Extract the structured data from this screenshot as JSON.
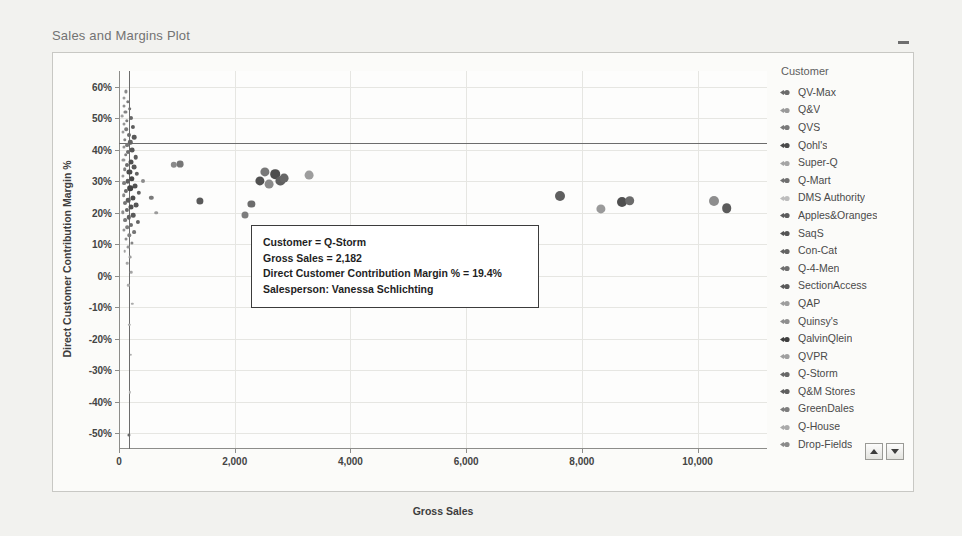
{
  "object": {
    "title": "Sales and Margins Plot",
    "minimize_label": "Minimize"
  },
  "legend": {
    "title": "Customer",
    "items": [
      {
        "label": "QV-Max",
        "color": "#6b6b6b"
      },
      {
        "label": "Q&V",
        "color": "#9a9a9a"
      },
      {
        "label": "QVS",
        "color": "#7a7a7a"
      },
      {
        "label": "Qohl's",
        "color": "#4a4a4a"
      },
      {
        "label": "Super-Q",
        "color": "#a5a5a5"
      },
      {
        "label": "Q-Mart",
        "color": "#707070"
      },
      {
        "label": "DMS Authority",
        "color": "#bdbdbd"
      },
      {
        "label": "Apples&Oranges",
        "color": "#5c5c5c"
      },
      {
        "label": "SaqS",
        "color": "#555555"
      },
      {
        "label": "Con-Cat",
        "color": "#636363"
      },
      {
        "label": "Q-4-Men",
        "color": "#6f6f6f"
      },
      {
        "label": "SectionAccess",
        "color": "#5a5a5a"
      },
      {
        "label": "QAP",
        "color": "#9e9e9e"
      },
      {
        "label": "Quinsy's",
        "color": "#8e8e8e"
      },
      {
        "label": "QalvinQlein",
        "color": "#3f3f3f"
      },
      {
        "label": "QVPR",
        "color": "#a0a0a0"
      },
      {
        "label": "Q-Storm",
        "color": "#686868"
      },
      {
        "label": "Q&M Stores",
        "color": "#5f5f5f"
      },
      {
        "label": "GreenDales",
        "color": "#7d7d7d"
      },
      {
        "label": "Q-House",
        "color": "#aaaaaa"
      },
      {
        "label": "Drop-Fields",
        "color": "#8a8a8a"
      }
    ],
    "scroll_up_label": "Scroll legend up",
    "scroll_down_label": "Scroll legend down"
  },
  "tooltip": {
    "line1": "Customer = Q-Storm",
    "line2": "Gross Sales = 2,182",
    "line3": "Direct Customer Contribution Margin % = 19.4%",
    "line4": "Salesperson: Vanessa Schlichting"
  },
  "chart_data": {
    "type": "scatter",
    "title": "Sales and Margins Plot",
    "xlabel": "Gross Sales",
    "ylabel": "Direct Customer Contribution Margin %",
    "xlim": [
      0,
      11200
    ],
    "ylim": [
      -0.55,
      0.65
    ],
    "xticks": [
      0,
      2000,
      4000,
      6000,
      8000,
      10000
    ],
    "xtick_labels": [
      "0",
      "2,000",
      "4,000",
      "6,000",
      "8,000",
      "10,000"
    ],
    "yticks": [
      0.6,
      0.5,
      0.4,
      0.3,
      0.2,
      0.1,
      0.0,
      -0.1,
      -0.2,
      -0.3,
      -0.4,
      -0.5
    ],
    "ytick_labels": [
      "60%",
      "50%",
      "40%",
      "30%",
      "20%",
      "10%",
      "0%",
      "-10%",
      "-20%",
      "-30%",
      "-40%",
      "-50%"
    ],
    "grid": true,
    "legend_position": "right",
    "reference_lines": [
      {
        "orientation": "horizontal",
        "value": 0.42
      },
      {
        "orientation": "vertical",
        "value": 170
      }
    ],
    "points": [
      {
        "x": 120,
        "y": 0.585,
        "r": 1.6,
        "c": "#8a8a8a"
      },
      {
        "x": 95,
        "y": 0.565,
        "r": 1.5,
        "c": "#9c9c9c"
      },
      {
        "x": 150,
        "y": 0.552,
        "r": 1.7,
        "c": "#7b7b7b"
      },
      {
        "x": 80,
        "y": 0.54,
        "r": 1.5,
        "c": "#8f8f8f"
      },
      {
        "x": 185,
        "y": 0.53,
        "r": 1.8,
        "c": "#6f6f6f"
      },
      {
        "x": 110,
        "y": 0.519,
        "r": 1.6,
        "c": "#848484"
      },
      {
        "x": 60,
        "y": 0.508,
        "r": 1.4,
        "c": "#a0a0a0"
      },
      {
        "x": 205,
        "y": 0.5,
        "r": 2.0,
        "c": "#676767"
      },
      {
        "x": 140,
        "y": 0.492,
        "r": 1.7,
        "c": "#7d7d7d"
      },
      {
        "x": 90,
        "y": 0.481,
        "r": 1.5,
        "c": "#959595"
      },
      {
        "x": 240,
        "y": 0.473,
        "r": 2.1,
        "c": "#5e5e5e"
      },
      {
        "x": 125,
        "y": 0.465,
        "r": 1.8,
        "c": "#7a7a7a"
      },
      {
        "x": 70,
        "y": 0.455,
        "r": 1.5,
        "c": "#9b9b9b"
      },
      {
        "x": 175,
        "y": 0.447,
        "r": 2.0,
        "c": "#6b6b6b"
      },
      {
        "x": 265,
        "y": 0.44,
        "r": 2.3,
        "c": "#585858"
      },
      {
        "x": 105,
        "y": 0.432,
        "r": 1.7,
        "c": "#828282"
      },
      {
        "x": 195,
        "y": 0.424,
        "r": 2.2,
        "c": "#636363"
      },
      {
        "x": 145,
        "y": 0.416,
        "r": 1.9,
        "c": "#757575"
      },
      {
        "x": 85,
        "y": 0.408,
        "r": 1.6,
        "c": "#909090"
      },
      {
        "x": 230,
        "y": 0.4,
        "r": 2.4,
        "c": "#565656"
      },
      {
        "x": 160,
        "y": 0.392,
        "r": 2.0,
        "c": "#6e6e6e"
      },
      {
        "x": 115,
        "y": 0.384,
        "r": 1.8,
        "c": "#7f7f7f"
      },
      {
        "x": 290,
        "y": 0.376,
        "r": 2.3,
        "c": "#5c5c5c"
      },
      {
        "x": 75,
        "y": 0.368,
        "r": 1.6,
        "c": "#949494"
      },
      {
        "x": 205,
        "y": 0.36,
        "r": 2.5,
        "c": "#4f4f4f"
      },
      {
        "x": 135,
        "y": 0.352,
        "r": 2.0,
        "c": "#6c6c6c"
      },
      {
        "x": 255,
        "y": 0.345,
        "r": 2.4,
        "c": "#585858"
      },
      {
        "x": 100,
        "y": 0.338,
        "r": 1.8,
        "c": "#808080"
      },
      {
        "x": 180,
        "y": 0.33,
        "r": 2.6,
        "c": "#4c4c4c"
      },
      {
        "x": 310,
        "y": 0.323,
        "r": 2.2,
        "c": "#626262"
      },
      {
        "x": 65,
        "y": 0.316,
        "r": 1.6,
        "c": "#9a9a9a"
      },
      {
        "x": 220,
        "y": 0.308,
        "r": 2.7,
        "c": "#474747"
      },
      {
        "x": 150,
        "y": 0.3,
        "r": 2.3,
        "c": "#5f5f5f"
      },
      {
        "x": 95,
        "y": 0.293,
        "r": 1.9,
        "c": "#7c7c7c"
      },
      {
        "x": 275,
        "y": 0.286,
        "r": 2.5,
        "c": "#525252"
      },
      {
        "x": 190,
        "y": 0.278,
        "r": 2.8,
        "c": "#444444"
      },
      {
        "x": 120,
        "y": 0.27,
        "r": 2.1,
        "c": "#6a6a6a"
      },
      {
        "x": 340,
        "y": 0.263,
        "r": 2.2,
        "c": "#616161"
      },
      {
        "x": 80,
        "y": 0.255,
        "r": 1.8,
        "c": "#888888"
      },
      {
        "x": 235,
        "y": 0.248,
        "r": 2.6,
        "c": "#4d4d4d"
      },
      {
        "x": 160,
        "y": 0.24,
        "r": 2.3,
        "c": "#5b5b5b"
      },
      {
        "x": 105,
        "y": 0.232,
        "r": 2.0,
        "c": "#737373"
      },
      {
        "x": 295,
        "y": 0.225,
        "r": 2.4,
        "c": "#565656"
      },
      {
        "x": 200,
        "y": 0.217,
        "r": 2.5,
        "c": "#505050"
      },
      {
        "x": 130,
        "y": 0.209,
        "r": 2.1,
        "c": "#686868"
      },
      {
        "x": 70,
        "y": 0.201,
        "r": 1.7,
        "c": "#8d8d8d"
      },
      {
        "x": 250,
        "y": 0.193,
        "r": 2.3,
        "c": "#5a5a5a"
      },
      {
        "x": 170,
        "y": 0.185,
        "r": 2.2,
        "c": "#606060"
      },
      {
        "x": 110,
        "y": 0.177,
        "r": 1.9,
        "c": "#787878"
      },
      {
        "x": 320,
        "y": 0.17,
        "r": 2.1,
        "c": "#656565"
      },
      {
        "x": 215,
        "y": 0.162,
        "r": 2.0,
        "c": "#6d6d6d"
      },
      {
        "x": 145,
        "y": 0.154,
        "r": 1.8,
        "c": "#7e7e7e"
      },
      {
        "x": 90,
        "y": 0.146,
        "r": 1.6,
        "c": "#929292"
      },
      {
        "x": 265,
        "y": 0.138,
        "r": 1.9,
        "c": "#747474"
      },
      {
        "x": 180,
        "y": 0.128,
        "r": 1.7,
        "c": "#818181"
      },
      {
        "x": 125,
        "y": 0.118,
        "r": 1.5,
        "c": "#8b8b8b"
      },
      {
        "x": 225,
        "y": 0.105,
        "r": 1.6,
        "c": "#868686"
      },
      {
        "x": 155,
        "y": 0.092,
        "r": 1.4,
        "c": "#979797"
      },
      {
        "x": 100,
        "y": 0.078,
        "r": 1.3,
        "c": "#a2a2a2"
      },
      {
        "x": 195,
        "y": 0.06,
        "r": 1.4,
        "c": "#9d9d9d"
      },
      {
        "x": 140,
        "y": 0.04,
        "r": 1.3,
        "c": "#a6a6a6"
      },
      {
        "x": 210,
        "y": 0.012,
        "r": 1.3,
        "c": "#a4a4a4"
      },
      {
        "x": 160,
        "y": -0.03,
        "r": 1.2,
        "c": "#aeaeae"
      },
      {
        "x": 230,
        "y": -0.09,
        "r": 1.2,
        "c": "#ababab"
      },
      {
        "x": 175,
        "y": -0.155,
        "r": 1.2,
        "c": "#b0b0b0"
      },
      {
        "x": 205,
        "y": -0.25,
        "r": 1.2,
        "c": "#adadad"
      },
      {
        "x": 190,
        "y": -0.37,
        "r": 1.2,
        "c": "#b2b2b2"
      },
      {
        "x": 165,
        "y": -0.505,
        "r": 1.6,
        "c": "#6a6a6a"
      },
      {
        "x": 420,
        "y": 0.3,
        "r": 2.0,
        "c": "#8c8c8c"
      },
      {
        "x": 560,
        "y": 0.248,
        "r": 2.2,
        "c": "#7a7a7a"
      },
      {
        "x": 640,
        "y": 0.2,
        "r": 1.8,
        "c": "#9b9b9b"
      },
      {
        "x": 950,
        "y": 0.352,
        "r": 3.2,
        "c": "#8a8a8a"
      },
      {
        "x": 1055,
        "y": 0.355,
        "r": 3.4,
        "c": "#767676"
      },
      {
        "x": 1400,
        "y": 0.238,
        "r": 3.6,
        "c": "#5a5a5a"
      },
      {
        "x": 2182,
        "y": 0.194,
        "r": 3.5,
        "c": "#7d7d7d"
      },
      {
        "x": 2290,
        "y": 0.228,
        "r": 3.6,
        "c": "#6c6c6c"
      },
      {
        "x": 2430,
        "y": 0.3,
        "r": 4.6,
        "c": "#515151"
      },
      {
        "x": 2520,
        "y": 0.33,
        "r": 4.6,
        "c": "#787878"
      },
      {
        "x": 2600,
        "y": 0.29,
        "r": 4.4,
        "c": "#8a8a8a"
      },
      {
        "x": 2700,
        "y": 0.322,
        "r": 4.8,
        "c": "#4d4d4d"
      },
      {
        "x": 2790,
        "y": 0.3,
        "r": 4.6,
        "c": "#5f5f5f"
      },
      {
        "x": 2860,
        "y": 0.31,
        "r": 4.4,
        "c": "#666666"
      },
      {
        "x": 3290,
        "y": 0.32,
        "r": 4.4,
        "c": "#9d9d9d"
      },
      {
        "x": 7620,
        "y": 0.252,
        "r": 5.0,
        "c": "#5f5f5f"
      },
      {
        "x": 8330,
        "y": 0.212,
        "r": 4.6,
        "c": "#9a9a9a"
      },
      {
        "x": 8700,
        "y": 0.234,
        "r": 5.0,
        "c": "#4f4f4f"
      },
      {
        "x": 8830,
        "y": 0.238,
        "r": 4.8,
        "c": "#6b6b6b"
      },
      {
        "x": 10280,
        "y": 0.238,
        "r": 5.0,
        "c": "#8e8e8e"
      },
      {
        "x": 10500,
        "y": 0.215,
        "r": 4.8,
        "c": "#5b5b5b"
      }
    ]
  }
}
